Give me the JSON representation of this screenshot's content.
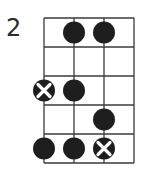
{
  "diagram": {
    "type": "fret-diagram",
    "starting_fret": "2",
    "strings": 4,
    "frets": 5,
    "grid": {
      "x_positions": [
        44,
        74,
        104,
        134
      ],
      "y_positions": [
        18,
        47,
        76,
        105,
        134,
        163
      ]
    },
    "colors": {
      "line": "#3a3a3a",
      "dot": "#1e1e1e",
      "x_mark": "#ffffff"
    },
    "markers": [
      {
        "string": 2,
        "fret": 1,
        "type": "dot"
      },
      {
        "string": 3,
        "fret": 1,
        "type": "dot"
      },
      {
        "string": 1,
        "fret": 3,
        "type": "x-dot"
      },
      {
        "string": 2,
        "fret": 3,
        "type": "dot"
      },
      {
        "string": 3,
        "fret": 4,
        "type": "dot"
      },
      {
        "string": 1,
        "fret": 5,
        "type": "dot"
      },
      {
        "string": 2,
        "fret": 5,
        "type": "dot"
      },
      {
        "string": 3,
        "fret": 5,
        "type": "x-dot"
      }
    ]
  }
}
